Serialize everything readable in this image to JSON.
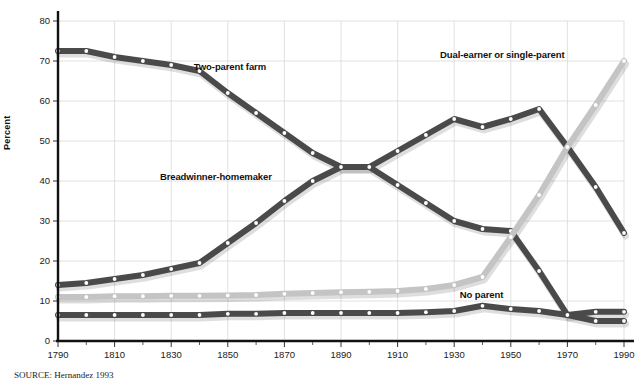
{
  "figure": {
    "source_note": "SOURCE: Hernandez 1993"
  },
  "chart_data": {
    "type": "line",
    "title": "",
    "xlabel": "",
    "ylabel": "Percent",
    "xlim": [
      1790,
      1990
    ],
    "ylim": [
      0,
      80
    ],
    "grid": true,
    "legend": "inline-labels",
    "x": [
      1790,
      1800,
      1810,
      1820,
      1830,
      1840,
      1850,
      1860,
      1870,
      1880,
      1890,
      1900,
      1910,
      1920,
      1930,
      1940,
      1950,
      1960,
      1970,
      1980,
      1990
    ],
    "xticks": [
      1790,
      1810,
      1830,
      1850,
      1870,
      1890,
      1910,
      1930,
      1950,
      1970,
      1990
    ],
    "xtick_labels": [
      "1790",
      "1810",
      "1830",
      "1850",
      "1870",
      "1890",
      "1910",
      "1930",
      "1950",
      "1970",
      "1990"
    ],
    "xminor_step": 10,
    "yticks": [
      0,
      10,
      20,
      30,
      40,
      50,
      60,
      70,
      80
    ],
    "ytick_labels": [
      "0",
      "10",
      "20",
      "30",
      "40",
      "50",
      "60",
      "70",
      "80"
    ],
    "series": [
      {
        "name": "Two-parent farm",
        "label": "Two-parent farm",
        "color": "#4a4a4a",
        "marker": "circle-white",
        "label_x": 1838,
        "label_y": 68.5,
        "values": [
          72.5,
          72.5,
          71.0,
          70.0,
          69.0,
          67.5,
          62.0,
          57.0,
          52.0,
          47.0,
          43.5,
          43.5,
          39.0,
          34.5,
          30.0,
          28.0,
          27.5,
          17.5,
          6.5,
          5.0,
          5.0
        ]
      },
      {
        "name": "Breadwinner-homemaker",
        "label": "Breadwinner-homemaker",
        "color": "#4a4a4a",
        "marker": "circle-white",
        "label_x": 1826,
        "label_y": 41.0,
        "values": [
          14.0,
          14.5,
          15.5,
          16.5,
          18.0,
          19.5,
          24.5,
          29.5,
          35.0,
          40.0,
          43.5,
          43.5,
          47.5,
          51.5,
          55.5,
          53.5,
          55.5,
          58.0,
          48.5,
          38.5,
          27.0
        ]
      },
      {
        "name": "Dual-earner or single-parent",
        "label": "Dual-earner or single-parent",
        "color": "#c4c4c4",
        "marker": "circle-white",
        "label_x": 1925,
        "label_y": 71.5,
        "values": [
          11.0,
          11.0,
          11.2,
          11.2,
          11.3,
          11.3,
          11.4,
          11.5,
          11.8,
          12.0,
          12.2,
          12.3,
          12.5,
          13.0,
          14.0,
          16.0,
          26.0,
          36.5,
          48.5,
          59.0,
          70.0
        ]
      },
      {
        "name": "No parent",
        "label": "No parent",
        "color": "#4a4a4a",
        "marker": "circle-white",
        "label_x": 1932,
        "label_y": 11.5,
        "values": [
          6.5,
          6.5,
          6.5,
          6.5,
          6.5,
          6.5,
          6.8,
          6.8,
          7.0,
          7.0,
          7.0,
          7.0,
          7.0,
          7.2,
          7.5,
          8.8,
          8.0,
          7.5,
          6.5,
          7.3,
          7.3
        ]
      }
    ]
  }
}
